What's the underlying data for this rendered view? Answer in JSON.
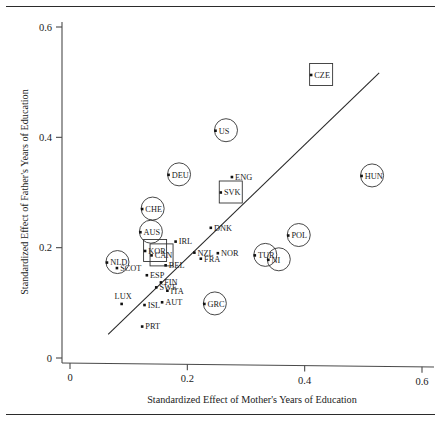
{
  "chart_data": {
    "type": "scatter",
    "title": "",
    "xlabel": "Standardized Effect of Mother's Years of Education",
    "ylabel": "Standardized Effect of Father's Years of Education",
    "xlim": [
      0,
      0.6
    ],
    "ylim": [
      0,
      0.6
    ],
    "xticks": [
      0,
      0.2,
      0.4,
      0.6
    ],
    "yticks": [
      0,
      0.2,
      0.4,
      0.6
    ],
    "xticklabels": [
      "0",
      "0.2",
      "0.4",
      "0.6"
    ],
    "yticklabels": [
      "0",
      "0.2",
      "0.4",
      "0.6"
    ],
    "grid": false,
    "legend": "none",
    "reference_line": {
      "name": "diagonal-fit-line",
      "x0": 0.065,
      "y0": 0.043,
      "x1": 0.527,
      "y1": 0.517
    },
    "points": [
      {
        "label": "CZE",
        "x": 0.411,
        "y": 0.513,
        "halo": "square",
        "label_pos": "right"
      },
      {
        "label": "US",
        "x": 0.248,
        "y": 0.412,
        "halo": "circle",
        "label_pos": "right"
      },
      {
        "label": "DEU",
        "x": 0.168,
        "y": 0.332,
        "halo": "circle",
        "label_pos": "right"
      },
      {
        "label": "HUN",
        "x": 0.497,
        "y": 0.33,
        "halo": "circle",
        "label_pos": "right"
      },
      {
        "label": "ENG",
        "x": 0.276,
        "y": 0.328,
        "halo": "none",
        "label_pos": "right"
      },
      {
        "label": "SVK",
        "x": 0.257,
        "y": 0.3,
        "halo": "square",
        "label_pos": "right"
      },
      {
        "label": "CHE",
        "x": 0.123,
        "y": 0.27,
        "halo": "circle",
        "label_pos": "right"
      },
      {
        "label": "DNK",
        "x": 0.24,
        "y": 0.236,
        "halo": "none",
        "label_pos": "right"
      },
      {
        "label": "AUS",
        "x": 0.12,
        "y": 0.228,
        "halo": "circle",
        "label_pos": "right"
      },
      {
        "label": "POL",
        "x": 0.372,
        "y": 0.222,
        "halo": "circle",
        "label_pos": "right"
      },
      {
        "label": "IRL",
        "x": 0.18,
        "y": 0.211,
        "halo": "none",
        "label_pos": "right"
      },
      {
        "label": "KOR",
        "x": 0.128,
        "y": 0.194,
        "halo": "square",
        "label_pos": "right"
      },
      {
        "label": "NZL",
        "x": 0.212,
        "y": 0.191,
        "halo": "none",
        "label_pos": "right"
      },
      {
        "label": "NOR",
        "x": 0.252,
        "y": 0.19,
        "halo": "none",
        "label_pos": "right"
      },
      {
        "label": "CAN",
        "x": 0.139,
        "y": 0.186,
        "halo": "square",
        "label_pos": "right"
      },
      {
        "label": "TUR",
        "x": 0.315,
        "y": 0.186,
        "halo": "circle",
        "label_pos": "right"
      },
      {
        "label": "FRA",
        "x": 0.223,
        "y": 0.18,
        "halo": "none",
        "label_pos": "right"
      },
      {
        "label": "NI",
        "x": 0.338,
        "y": 0.178,
        "halo": "circle",
        "label_pos": "right"
      },
      {
        "label": "NLD",
        "x": 0.063,
        "y": 0.173,
        "halo": "circle",
        "label_pos": "right"
      },
      {
        "label": "BEL",
        "x": 0.163,
        "y": 0.168,
        "halo": "none",
        "label_pos": "right"
      },
      {
        "label": "SCOT",
        "x": 0.08,
        "y": 0.163,
        "halo": "none",
        "label_pos": "right"
      },
      {
        "label": "ESP",
        "x": 0.131,
        "y": 0.15,
        "halo": "none",
        "label_pos": "right"
      },
      {
        "label": "FIN",
        "x": 0.155,
        "y": 0.137,
        "halo": "none",
        "label_pos": "right"
      },
      {
        "label": "SWE",
        "x": 0.147,
        "y": 0.128,
        "halo": "none",
        "label_pos": "right"
      },
      {
        "label": "ITA",
        "x": 0.166,
        "y": 0.122,
        "halo": "none",
        "label_pos": "right"
      },
      {
        "label": "AUT",
        "x": 0.157,
        "y": 0.101,
        "halo": "none",
        "label_pos": "right"
      },
      {
        "label": "GRC",
        "x": 0.229,
        "y": 0.098,
        "halo": "circle",
        "label_pos": "right"
      },
      {
        "label": "ISL",
        "x": 0.127,
        "y": 0.096,
        "halo": "none",
        "label_pos": "right"
      },
      {
        "label": "LUX",
        "x": 0.088,
        "y": 0.098,
        "halo": "none",
        "label_pos": "above-left"
      },
      {
        "label": "PRT",
        "x": 0.123,
        "y": 0.057,
        "halo": "none",
        "label_pos": "right"
      }
    ]
  }
}
